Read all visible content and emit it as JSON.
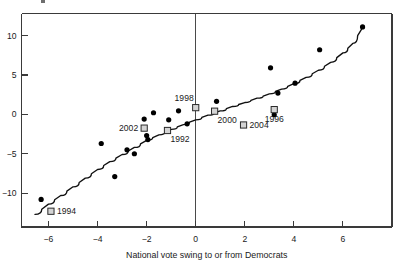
{
  "chart_data": {
    "type": "scatter",
    "title": "",
    "xlabel": "National vote swing to or from Democrats",
    "ylabel": "",
    "xlim": [
      -7.1,
      8.0
    ],
    "ylim": [
      -14.3,
      12.8
    ],
    "grid": false,
    "legend": null,
    "xticks": [
      -6,
      -4,
      -2,
      0,
      2,
      4,
      6
    ],
    "xtick_labels": [
      "−6",
      "−4",
      "−2",
      "0",
      "2",
      "4",
      "6"
    ],
    "yticks": [
      -10,
      -5,
      0,
      5,
      10
    ],
    "ytick_labels": [
      "−10",
      "−5",
      "0",
      "5",
      "10"
    ],
    "annotations": [
      {
        "text": "vertical reference line at x = 0"
      }
    ],
    "series": [
      {
        "name": "elections",
        "marker": "filled-circle",
        "color": "#000000",
        "points": [
          {
            "x": -6.3,
            "y": -10.8
          },
          {
            "x": -3.85,
            "y": -3.7
          },
          {
            "x": -3.3,
            "y": -7.9
          },
          {
            "x": -2.8,
            "y": -4.5
          },
          {
            "x": -2.5,
            "y": -5.0
          },
          {
            "x": -2.1,
            "y": -0.6
          },
          {
            "x": -2.0,
            "y": -2.7
          },
          {
            "x": -1.95,
            "y": -3.2
          },
          {
            "x": -1.72,
            "y": 0.2
          },
          {
            "x": -1.1,
            "y": -0.7
          },
          {
            "x": -0.7,
            "y": 0.45
          },
          {
            "x": -0.35,
            "y": -1.2
          },
          {
            "x": 0.85,
            "y": 1.65
          },
          {
            "x": 3.05,
            "y": 5.9
          },
          {
            "x": 3.2,
            "y": -0.05
          },
          {
            "x": 3.35,
            "y": 2.7
          },
          {
            "x": 4.05,
            "y": 3.95
          },
          {
            "x": 5.05,
            "y": 8.2
          },
          {
            "x": 6.8,
            "y": 11.1
          }
        ]
      },
      {
        "name": "labeled-elections",
        "marker": "open-square",
        "color": "#d4d4d4",
        "points": [
          {
            "x": -5.9,
            "y": -12.3,
            "label": "1994",
            "label_pos": "right"
          },
          {
            "x": -2.1,
            "y": -1.75,
            "label": "2002",
            "label_pos": "left"
          },
          {
            "x": -1.15,
            "y": -2.05,
            "label": "1992",
            "label_pos": "below-right"
          },
          {
            "x": 0.0,
            "y": 0.85,
            "label": "1998",
            "label_pos": "above-left"
          },
          {
            "x": 0.77,
            "y": 0.4,
            "label": "2000",
            "label_pos": "below-right"
          },
          {
            "x": 1.95,
            "y": -1.35,
            "label": "2004",
            "label_pos": "right"
          },
          {
            "x": 3.2,
            "y": 0.6,
            "label": "1996",
            "label_pos": "below"
          }
        ]
      }
    ],
    "fit_curve": {
      "name": "smoothed trend line",
      "style": "solid",
      "color": "#111111",
      "points": [
        {
          "x": -6.55,
          "y": -12.7
        },
        {
          "x": -6.0,
          "y": -11.4
        },
        {
          "x": -5.5,
          "y": -10.3
        },
        {
          "x": -5.0,
          "y": -9.2
        },
        {
          "x": -4.5,
          "y": -8.1
        },
        {
          "x": -4.0,
          "y": -7.0
        },
        {
          "x": -3.5,
          "y": -6.0
        },
        {
          "x": -3.0,
          "y": -5.1
        },
        {
          "x": -2.5,
          "y": -4.2
        },
        {
          "x": -2.0,
          "y": -3.3
        },
        {
          "x": -1.5,
          "y": -2.6
        },
        {
          "x": -1.0,
          "y": -1.9
        },
        {
          "x": -0.5,
          "y": -1.3
        },
        {
          "x": 0.0,
          "y": -0.7
        },
        {
          "x": 0.5,
          "y": -0.1
        },
        {
          "x": 1.0,
          "y": 0.45
        },
        {
          "x": 1.5,
          "y": 1.0
        },
        {
          "x": 2.0,
          "y": 1.5
        },
        {
          "x": 2.5,
          "y": 2.05
        },
        {
          "x": 3.0,
          "y": 2.6
        },
        {
          "x": 3.5,
          "y": 3.2
        },
        {
          "x": 4.0,
          "y": 3.9
        },
        {
          "x": 4.5,
          "y": 4.7
        },
        {
          "x": 5.0,
          "y": 5.6
        },
        {
          "x": 5.5,
          "y": 6.6
        },
        {
          "x": 6.0,
          "y": 7.8
        },
        {
          "x": 6.4,
          "y": 9.0
        },
        {
          "x": 6.8,
          "y": 11.0
        }
      ]
    }
  }
}
